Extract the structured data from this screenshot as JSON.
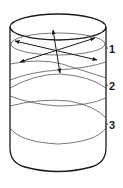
{
  "diagram": {
    "labels": [
      {
        "id": "1",
        "text": "1"
      },
      {
        "id": "2",
        "text": "2"
      },
      {
        "id": "3",
        "text": "3"
      }
    ],
    "colors": {
      "stroke_dark": "#1a1a1a",
      "stroke_light": "#555555",
      "background": "#ffffff"
    }
  }
}
